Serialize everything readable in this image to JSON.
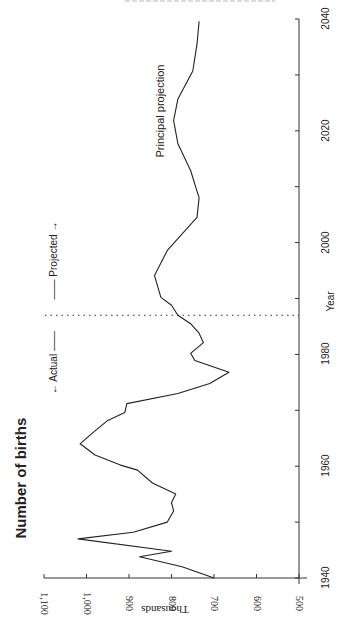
{
  "figure": {
    "title": "Number of births",
    "series_label": "Principal projection",
    "annotations": {
      "actual": "← Actual ——",
      "projected": "—— Projected →"
    },
    "orientation": "rotated 90° counter-clockwise (years run bottom-to-top on right axis)"
  },
  "chart_data": {
    "type": "line",
    "title": "Number of births",
    "xlabel": "Year",
    "ylabel": "Thousands",
    "xlim": [
      1940,
      2040
    ],
    "ylim": [
      500,
      1100
    ],
    "x_ticks": [
      "1940",
      "1960",
      "1980",
      "2000",
      "2020",
      "2040"
    ],
    "x_minor_ticks": [
      1950,
      1970,
      1990,
      2010,
      2030
    ],
    "y_ticks": [
      "500",
      "600",
      "700",
      "800",
      "900",
      "1,000",
      "1,100"
    ],
    "grid": false,
    "legend": "none",
    "divider": {
      "year": 1987,
      "style": "dotted",
      "left_label": "Actual",
      "right_label": "Projected"
    },
    "series": [
      {
        "name": "Principal projection",
        "x": [
          1940,
          1942,
          1943.8,
          1944.8,
          1947,
          1948.2,
          1950,
          1952,
          1953.5,
          1955,
          1957,
          1959.3,
          1960.2,
          1962,
          1964,
          1966,
          1968.2,
          1969.6,
          1971.2,
          1973,
          1974.8,
          1976.8,
          1978.9,
          1980.2,
          1982.1,
          1983.8,
          1985.5,
          1987,
          1988.8,
          1990.2,
          1994.1,
          1998.6,
          2004.5,
          2008,
          2012.9,
          2017.7,
          2021.8,
          2025.7,
          2030.7,
          2035.5,
          2039.6
        ],
        "values": [
          700,
          775,
          875,
          800,
          1020,
          890,
          810,
          795,
          800,
          790,
          845,
          880,
          920,
          980,
          1015,
          985,
          950,
          910,
          905,
          785,
          710,
          665,
          745,
          755,
          725,
          735,
          755,
          785,
          800,
          825,
          840,
          810,
          740,
          735,
          755,
          785,
          795,
          785,
          750,
          740,
          735
        ]
      }
    ]
  }
}
